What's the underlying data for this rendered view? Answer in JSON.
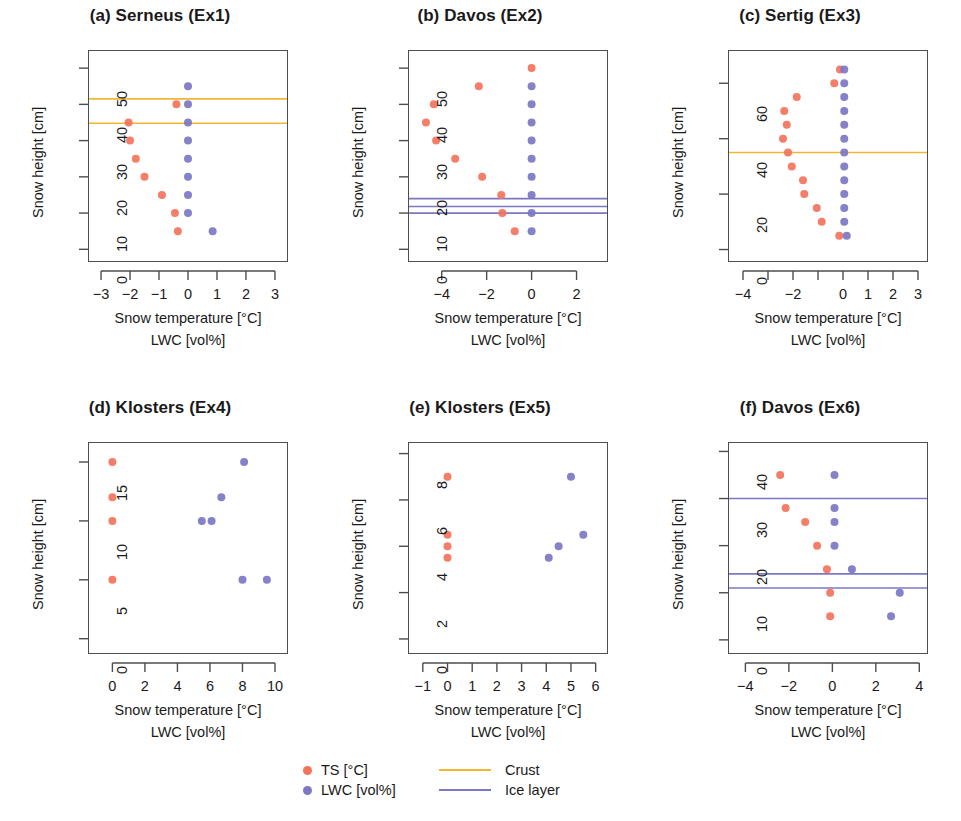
{
  "colors": {
    "ts_point": "#F4735B",
    "lwc_point": "#7B77C4",
    "crust_line": "#F2B632",
    "ice_line": "#7B77C4",
    "axis": "#4d4d4d",
    "text": "#1a1a1a"
  },
  "legend": {
    "items": [
      {
        "marker": "dot",
        "color_key": "ts_point",
        "label": "TS [°C]"
      },
      {
        "marker": "dot",
        "color_key": "lwc_point",
        "label": "LWC [vol%]"
      },
      {
        "marker": "line",
        "color_key": "crust_line",
        "label": "Crust"
      },
      {
        "marker": "line",
        "color_key": "ice_line",
        "label": "Ice layer"
      }
    ]
  },
  "axis_labels": {
    "x_line1": "Snow temperature [°C]",
    "x_line2": "LWC [vol%]",
    "y": "Snow height [cm]"
  },
  "chart_data": [
    {
      "id": "a",
      "type": "scatter",
      "title": "(a) Serneus (Ex1)",
      "xlabel": "Snow temperature [°C] / LWC [vol%]",
      "ylabel": "Snow height [cm]",
      "xlim": [
        -3.45,
        3.45
      ],
      "ylim": [
        -3.5,
        55
      ],
      "xticks": [
        -3,
        -2,
        -1,
        0,
        1,
        2,
        3
      ],
      "xticklabels": [
        "-3",
        "-2",
        "-1",
        "0",
        "1",
        "2",
        "3"
      ],
      "yticks": [
        0,
        10,
        20,
        30,
        40,
        50
      ],
      "yticklabels": [
        "0",
        "10",
        "20",
        "30",
        "40",
        "50"
      ],
      "grid": false,
      "series": [
        {
          "name": "TS [°C]",
          "color_key": "ts_point",
          "points": [
            [
              -0.4,
              40
            ],
            [
              -2.05,
              35
            ],
            [
              -2.0,
              30
            ],
            [
              -1.8,
              25
            ],
            [
              -1.5,
              20
            ],
            [
              -0.9,
              15
            ],
            [
              -0.45,
              10
            ],
            [
              -0.35,
              5
            ]
          ]
        },
        {
          "name": "LWC [vol%]",
          "color_key": "lwc_point",
          "points": [
            [
              0.0,
              45
            ],
            [
              0.0,
              40
            ],
            [
              0.0,
              35
            ],
            [
              0.0,
              30
            ],
            [
              0.0,
              25
            ],
            [
              0.0,
              20
            ],
            [
              0.0,
              15
            ],
            [
              0.0,
              10
            ],
            [
              0.85,
              5
            ]
          ]
        }
      ],
      "hlines": [
        {
          "kind": "Crust",
          "color_key": "crust_line",
          "y": 41.5
        },
        {
          "kind": "Crust",
          "color_key": "crust_line",
          "y": 34.8
        }
      ]
    },
    {
      "id": "b",
      "type": "scatter",
      "title": "(b) Davos (Ex2)",
      "xlabel": "Snow temperature [°C] / LWC [vol%]",
      "ylabel": "Snow height [cm]",
      "xlim": [
        -5.5,
        3.4
      ],
      "ylim": [
        -3.5,
        55
      ],
      "xticks": [
        -4,
        -2,
        0,
        2
      ],
      "xticklabels": [
        "-4",
        "-2",
        "0",
        "2"
      ],
      "yticks": [
        0,
        10,
        20,
        30,
        40,
        50
      ],
      "yticklabels": [
        "0",
        "10",
        "20",
        "30",
        "40",
        "50"
      ],
      "grid": false,
      "series": [
        {
          "name": "TS [°C]",
          "color_key": "ts_point",
          "points": [
            [
              0.0,
              50
            ],
            [
              -2.35,
              45
            ],
            [
              -4.35,
              40
            ],
            [
              -4.7,
              35
            ],
            [
              -4.25,
              30
            ],
            [
              -3.4,
              25
            ],
            [
              -2.2,
              20
            ],
            [
              -1.35,
              15
            ],
            [
              -1.3,
              10
            ],
            [
              -0.75,
              5
            ]
          ]
        },
        {
          "name": "LWC [vol%]",
          "color_key": "lwc_point",
          "points": [
            [
              0.0,
              45
            ],
            [
              0.0,
              40
            ],
            [
              0.0,
              35
            ],
            [
              0.0,
              30
            ],
            [
              0.0,
              25
            ],
            [
              0.0,
              20
            ],
            [
              0.0,
              15
            ],
            [
              0.0,
              10
            ],
            [
              0.0,
              5
            ]
          ]
        }
      ],
      "hlines": [
        {
          "kind": "Ice layer",
          "color_key": "ice_line",
          "y": 14.0
        },
        {
          "kind": "Ice layer",
          "color_key": "ice_line",
          "y": 11.8
        },
        {
          "kind": "Ice layer",
          "color_key": "ice_line",
          "y": 10.0
        }
      ]
    },
    {
      "id": "c",
      "type": "scatter",
      "title": "(c) Sertig (Ex3)",
      "xlabel": "Snow temperature [°C] / LWC [vol%]",
      "ylabel": "Snow height [cm]",
      "xlim": [
        -4.6,
        3.4
      ],
      "ylim": [
        -4.5,
        72
      ],
      "xticks": [
        -4,
        -3,
        -2,
        -1,
        0,
        1,
        2,
        3
      ],
      "xticklabels": [
        "-4",
        "",
        "-2",
        "",
        "0",
        "1",
        "2",
        "3"
      ],
      "yticks": [
        0,
        20,
        40,
        60
      ],
      "yticklabels": [
        "0",
        "20",
        "40",
        "60"
      ],
      "grid": false,
      "series": [
        {
          "name": "TS [°C]",
          "color_key": "ts_point",
          "points": [
            [
              -0.12,
              65
            ],
            [
              -0.35,
              60
            ],
            [
              -1.85,
              55
            ],
            [
              -2.35,
              50
            ],
            [
              -2.25,
              45
            ],
            [
              -2.4,
              40
            ],
            [
              -2.2,
              35
            ],
            [
              -2.05,
              30
            ],
            [
              -1.6,
              25
            ],
            [
              -1.55,
              20
            ],
            [
              -1.05,
              15
            ],
            [
              -0.85,
              10
            ],
            [
              -0.15,
              5
            ]
          ]
        },
        {
          "name": "LWC [vol%]",
          "color_key": "lwc_point",
          "points": [
            [
              0.05,
              65
            ],
            [
              0.05,
              60
            ],
            [
              0.05,
              55
            ],
            [
              0.05,
              50
            ],
            [
              0.05,
              45
            ],
            [
              0.05,
              40
            ],
            [
              0.05,
              35
            ],
            [
              0.05,
              30
            ],
            [
              0.05,
              25
            ],
            [
              0.05,
              20
            ],
            [
              0.05,
              15
            ],
            [
              0.05,
              10
            ],
            [
              0.15,
              5
            ]
          ]
        }
      ],
      "hlines": [
        {
          "kind": "Crust",
          "color_key": "crust_line",
          "y": 35.0
        }
      ]
    },
    {
      "id": "d",
      "type": "scatter",
      "title": "(d) Klosters (Ex4)",
      "xlabel": "Snow temperature [°C] / LWC [vol%]",
      "ylabel": "Snow height [cm]",
      "xlim": [
        -1.5,
        10.8
      ],
      "ylim": [
        -1.3,
        16.7
      ],
      "xticks": [
        0,
        2,
        4,
        6,
        8,
        10
      ],
      "xticklabels": [
        "0",
        "2",
        "4",
        "6",
        "8",
        "10"
      ],
      "yticks": [
        0,
        5,
        10,
        15
      ],
      "yticklabels": [
        "0",
        "5",
        "10",
        "15"
      ],
      "grid": false,
      "series": [
        {
          "name": "TS [°C]",
          "color_key": "ts_point",
          "points": [
            [
              0.0,
              15
            ],
            [
              0.0,
              12
            ],
            [
              0.0,
              10
            ],
            [
              0.0,
              5
            ]
          ]
        },
        {
          "name": "LWC [vol%]",
          "color_key": "lwc_point",
          "points": [
            [
              8.1,
              15
            ],
            [
              6.7,
              12
            ],
            [
              5.5,
              10
            ],
            [
              6.1,
              10
            ],
            [
              8.0,
              5
            ],
            [
              9.5,
              5
            ]
          ]
        }
      ],
      "hlines": []
    },
    {
      "id": "e",
      "type": "scatter",
      "title": "(e) Klosters (Ex5)",
      "xlabel": "Snow temperature [°C] / LWC [vol%]",
      "ylabel": "Snow height [cm]",
      "xlim": [
        -1.6,
        6.5
      ],
      "ylim": [
        -0.65,
        8.5
      ],
      "xticks": [
        -1,
        0,
        1,
        2,
        3,
        4,
        5,
        6
      ],
      "xticklabels": [
        "-1",
        "0",
        "1",
        "2",
        "3",
        "4",
        "5",
        "6"
      ],
      "yticks": [
        0,
        2,
        4,
        6,
        8
      ],
      "yticklabels": [
        "0",
        "2",
        "4",
        "6",
        "8"
      ],
      "grid": false,
      "series": [
        {
          "name": "TS [°C]",
          "color_key": "ts_point",
          "points": [
            [
              0.0,
              7
            ],
            [
              0.0,
              4.5
            ],
            [
              0.0,
              4
            ],
            [
              0.0,
              3.5
            ]
          ]
        },
        {
          "name": "LWC [vol%]",
          "color_key": "lwc_point",
          "points": [
            [
              5.0,
              7
            ],
            [
              5.5,
              4.5
            ],
            [
              4.5,
              4
            ],
            [
              4.1,
              3.5
            ]
          ]
        }
      ],
      "hlines": []
    },
    {
      "id": "f",
      "type": "scatter",
      "title": "(f) Davos (Ex6)",
      "xlabel": "Snow temperature [°C] / LWC [vol%]",
      "ylabel": "Snow height [cm]",
      "xlim": [
        -4.8,
        4.4
      ],
      "ylim": [
        -3.0,
        42
      ],
      "xticks": [
        -4,
        -2,
        0,
        2,
        4
      ],
      "xticklabels": [
        "-4",
        "-2",
        "0",
        "2",
        "4"
      ],
      "yticks": [
        0,
        10,
        20,
        30,
        40
      ],
      "yticklabels": [
        "0",
        "10",
        "20",
        "30",
        "40"
      ],
      "grid": false,
      "series": [
        {
          "name": "TS [°C]",
          "color_key": "ts_point",
          "points": [
            [
              -2.4,
              35
            ],
            [
              -2.15,
              28
            ],
            [
              -1.25,
              25
            ],
            [
              -0.7,
              20
            ],
            [
              -0.25,
              15
            ],
            [
              -0.1,
              10
            ],
            [
              -0.1,
              5
            ]
          ]
        },
        {
          "name": "LWC [vol%]",
          "color_key": "lwc_point",
          "points": [
            [
              0.1,
              35
            ],
            [
              0.1,
              28
            ],
            [
              0.1,
              25
            ],
            [
              0.1,
              20
            ],
            [
              0.9,
              15
            ],
            [
              3.1,
              10
            ],
            [
              2.7,
              5
            ]
          ]
        }
      ],
      "hlines": [
        {
          "kind": "Ice layer",
          "color_key": "ice_line",
          "y": 30.0
        },
        {
          "kind": "Ice layer",
          "color_key": "ice_line",
          "y": 14.0
        },
        {
          "kind": "Ice layer",
          "color_key": "ice_line",
          "y": 11.0
        }
      ]
    }
  ]
}
